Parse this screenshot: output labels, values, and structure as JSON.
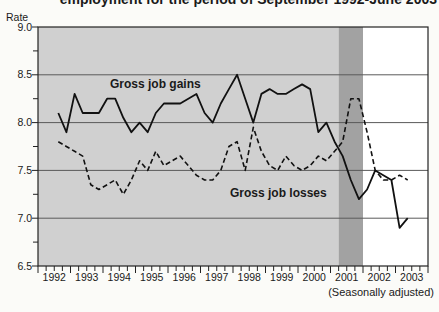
{
  "page": {
    "title_clipped": "employment for the period of September 1992-June 2003",
    "footnote": "(Seasonally adjusted)"
  },
  "axes": {
    "y_title": "Rate",
    "y_tick_labels": [
      "9.0",
      "8.5",
      "8.0",
      "7.5",
      "7.0",
      "6.5"
    ],
    "x_tick_labels": [
      "1992",
      "1993",
      "1994",
      "1995",
      "1996",
      "1997",
      "1998",
      "1999",
      "2000",
      "2001",
      "2002",
      "2003"
    ]
  },
  "annotations": {
    "gains_label": "Gross job gains",
    "losses_label": "Gross job losses"
  },
  "colors": {
    "plot_background": "#d0d0d0",
    "recession_band": "#a2a2a2",
    "post_band_background": "#ffffff",
    "gridline": "#5a5a5a",
    "frame": "#222222",
    "line": "#111111",
    "text": "#1a1a1a"
  },
  "chart_data": {
    "type": "line",
    "ylabel": "Rate",
    "ylim": [
      6.5,
      9.0
    ],
    "y_major_step": 0.5,
    "y_minor_step": 0.25,
    "grid": "horizontal",
    "x_unit": "quarterly",
    "x_start": "1992 Q3",
    "x_end": "2003 Q2",
    "footnote": "(Seasonally adjusted)",
    "shading": {
      "gray_region": {
        "from": "1992 Q1",
        "to": "2001 Q1"
      },
      "recession_band": {
        "from": "2001 Q2",
        "to": "2001 Q4"
      }
    },
    "categories": [
      "1992 Q3",
      "1992 Q4",
      "1993 Q1",
      "1993 Q2",
      "1993 Q3",
      "1993 Q4",
      "1994 Q1",
      "1994 Q2",
      "1994 Q3",
      "1994 Q4",
      "1995 Q1",
      "1995 Q2",
      "1995 Q3",
      "1995 Q4",
      "1996 Q1",
      "1996 Q2",
      "1996 Q3",
      "1996 Q4",
      "1997 Q1",
      "1997 Q2",
      "1997 Q3",
      "1997 Q4",
      "1998 Q1",
      "1998 Q2",
      "1998 Q3",
      "1998 Q4",
      "1999 Q1",
      "1999 Q2",
      "1999 Q3",
      "1999 Q4",
      "2000 Q1",
      "2000 Q2",
      "2000 Q3",
      "2000 Q4",
      "2001 Q1",
      "2001 Q2",
      "2001 Q3",
      "2001 Q4",
      "2002 Q1",
      "2002 Q2",
      "2002 Q3",
      "2002 Q4",
      "2003 Q1",
      "2003 Q2"
    ],
    "series": [
      {
        "name": "Gross job gains",
        "style": "solid",
        "values": [
          8.1,
          7.9,
          8.3,
          8.1,
          8.1,
          8.1,
          8.25,
          8.25,
          8.05,
          7.9,
          8.0,
          7.9,
          8.1,
          8.2,
          8.2,
          8.2,
          8.25,
          8.3,
          8.1,
          8.0,
          8.2,
          8.35,
          8.5,
          8.25,
          8.0,
          8.3,
          8.35,
          8.3,
          8.3,
          8.35,
          8.4,
          8.35,
          7.9,
          8.0,
          7.8,
          7.65,
          7.4,
          7.2,
          7.3,
          7.5,
          7.45,
          7.4,
          6.9,
          7.0
        ]
      },
      {
        "name": "Gross job losses",
        "style": "dashed",
        "values": [
          7.8,
          7.75,
          7.7,
          7.65,
          7.35,
          7.3,
          7.35,
          7.4,
          7.25,
          7.4,
          7.6,
          7.5,
          7.7,
          7.55,
          7.6,
          7.65,
          7.55,
          7.45,
          7.4,
          7.4,
          7.5,
          7.75,
          7.8,
          7.5,
          7.95,
          7.7,
          7.55,
          7.5,
          7.65,
          7.55,
          7.5,
          7.55,
          7.65,
          7.6,
          7.7,
          7.8,
          8.25,
          8.25,
          7.9,
          7.5,
          7.4,
          7.4,
          7.45,
          7.4
        ]
      }
    ]
  }
}
